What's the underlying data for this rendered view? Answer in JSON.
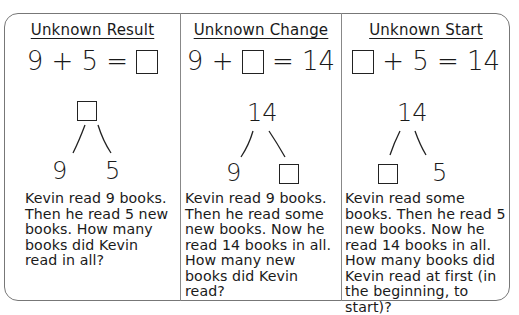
{
  "columns": [
    {
      "title": "Unknown Result",
      "equation": {
        "parts": [
          "9 + 5 = ",
          "[box]"
        ],
        "left": "9 + 5 =",
        "right": ""
      },
      "number_bond": {
        "whole": "[box]",
        "part_left": "9",
        "part_right": "5"
      },
      "story": "Kevin read 9 books. Then he read 5 new books. How many books did Kevin read in all?"
    },
    {
      "title": "Unknown Change",
      "equation": {
        "left": "9 +",
        "right": "= 14"
      },
      "number_bond": {
        "whole": "14",
        "part_left": "9",
        "part_right": "[box]"
      },
      "story": "Kevin read 9 books. Then he read some new books. Now he read 14 books in all. How many new books did Kevin read?"
    },
    {
      "title": "Unknown Start",
      "equation": {
        "left": "",
        "right": "+ 5 = 14"
      },
      "number_bond": {
        "whole": "14",
        "part_left": "[box]",
        "part_right": "5"
      },
      "story": "Kevin read some books. Then he read 5 new books. Now he read 14 books in all. How many books did Kevin read at first (in the beginning, to start)?"
    }
  ]
}
